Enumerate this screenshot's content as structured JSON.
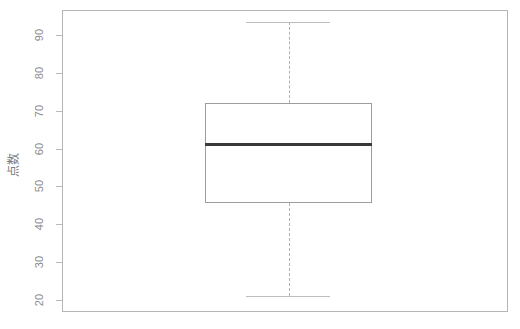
{
  "chart_data": {
    "type": "box",
    "title": "",
    "xlabel": "",
    "ylabel": "点数",
    "ylim": [
      18,
      95
    ],
    "grid": false,
    "legend": null,
    "yticks": [
      90,
      80,
      70,
      60,
      50,
      40,
      30,
      20
    ],
    "ytick_labels": [
      "90",
      "80",
      "70",
      "60",
      "50",
      "40",
      "30",
      "20"
    ],
    "categories": [
      ""
    ],
    "series": [
      {
        "name": "点数",
        "min": 21,
        "q1": 45.5,
        "median": 61,
        "q3": 72,
        "max": 93.5,
        "outliers": []
      }
    ],
    "box_color": "#9d9d9d",
    "median_color": "#3a3a3a",
    "whisker_color": "#b0b0b0",
    "frame_color": "#b5b5b5",
    "background": "#ffffff"
  },
  "ticks": [
    {
      "label": "90",
      "value": 90
    },
    {
      "label": "80",
      "value": 80
    },
    {
      "label": "70",
      "value": 70
    },
    {
      "label": "60",
      "value": 60
    },
    {
      "label": "50",
      "value": 50
    },
    {
      "label": "40",
      "value": 40
    },
    {
      "label": "30",
      "value": 30
    },
    {
      "label": "20",
      "value": 20
    }
  ],
  "axis": {
    "ylabel": "点数"
  }
}
